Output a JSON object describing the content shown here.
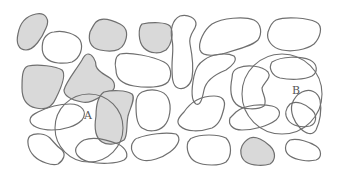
{
  "diagram": {
    "type": "scattered irregular blobs with two sampling circles",
    "colors": {
      "stroke": "#6f6f6f",
      "shaded_fill": "#d9d9d9",
      "background": "#ffffff",
      "label": "#555555"
    },
    "labels": {
      "A": "A",
      "B": "B"
    },
    "circles": [
      {
        "id": "A",
        "cx": 89,
        "cy": 128,
        "r": 34
      },
      {
        "id": "B",
        "cx": 282,
        "cy": 94,
        "r": 40
      }
    ],
    "shaded_blob_count": 8,
    "outline_blob_count": 22
  }
}
